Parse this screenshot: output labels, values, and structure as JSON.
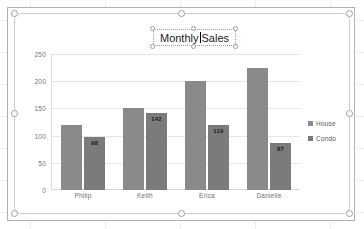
{
  "chart": {
    "title_part1": "Monthly",
    "title_part2": "Sales",
    "title_full": "Monthly Sales",
    "title_editing": true,
    "selected": true
  },
  "legend": {
    "position": "right",
    "items": [
      {
        "label": "House",
        "color": "#8a8a8a"
      },
      {
        "label": "Condo",
        "color": "#7b7b7b"
      }
    ]
  },
  "axis": {
    "y_ticks": [
      "250",
      "200",
      "150",
      "100",
      "50",
      "0"
    ],
    "x_labels": [
      "Philip",
      "Keith",
      "Erica",
      "Danielle"
    ]
  },
  "chart_data": {
    "type": "bar",
    "xlabel": "",
    "ylabel": "",
    "ylim": [
      0,
      250
    ],
    "ytick_step": 50,
    "grid": true,
    "legend_position": "right",
    "categories": [
      "Philip",
      "Keith",
      "Erica",
      "Danielle"
    ],
    "series": [
      {
        "name": "House",
        "color": "#8a8a8a",
        "values": [
          120,
          150,
          201,
          225
        ],
        "data_labels": [
          "",
          "",
          "",
          ""
        ]
      },
      {
        "name": "Condo",
        "color": "#7b7b7b",
        "values": [
          98,
          142,
          119,
          87
        ],
        "data_labels": [
          "98",
          "142",
          "119",
          "87"
        ]
      }
    ]
  }
}
